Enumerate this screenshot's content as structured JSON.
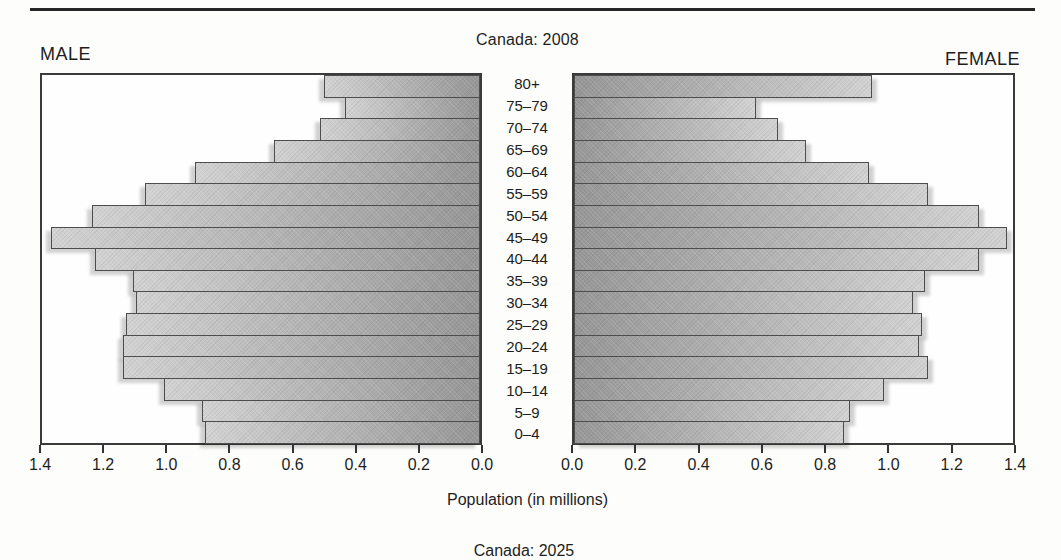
{
  "footer": {
    "next_figure_caption": "Canada: 2025"
  },
  "chart_data": {
    "type": "bar",
    "variant": "population_pyramid",
    "title": "Canada: 2008",
    "left_header": "MALE",
    "right_header": "FEMALE",
    "xlabel": "Population (in millions)",
    "xlim": [
      0,
      1.4
    ],
    "tick_step": 0.2,
    "tick_labels": [
      "0.0",
      "0.2",
      "0.4",
      "0.6",
      "0.8",
      "1.0",
      "1.2",
      "1.4"
    ],
    "grid": false,
    "categories": [
      "80+",
      "75–79",
      "70–74",
      "65–69",
      "60–64",
      "55–59",
      "50–54",
      "45–49",
      "40–44",
      "35–39",
      "30–34",
      "25–29",
      "20–24",
      "15–19",
      "10–14",
      "5–9",
      "0–4"
    ],
    "series": [
      {
        "name": "Male",
        "values": [
          0.5,
          0.43,
          0.51,
          0.66,
          0.91,
          1.07,
          1.24,
          1.37,
          1.23,
          1.11,
          1.1,
          1.13,
          1.14,
          1.14,
          1.01,
          0.89,
          0.88
        ]
      },
      {
        "name": "Female",
        "values": [
          0.95,
          0.58,
          0.65,
          0.74,
          0.94,
          1.13,
          1.29,
          1.38,
          1.29,
          1.12,
          1.08,
          1.11,
          1.1,
          1.13,
          0.99,
          0.88,
          0.86
        ]
      }
    ],
    "colors": {
      "bar_light": "#d2d2d2",
      "bar_dark": "#969696",
      "bar_border": "#4d4d4d",
      "panel_border": "#3b3b3b",
      "text": "#1e1e1e"
    }
  }
}
